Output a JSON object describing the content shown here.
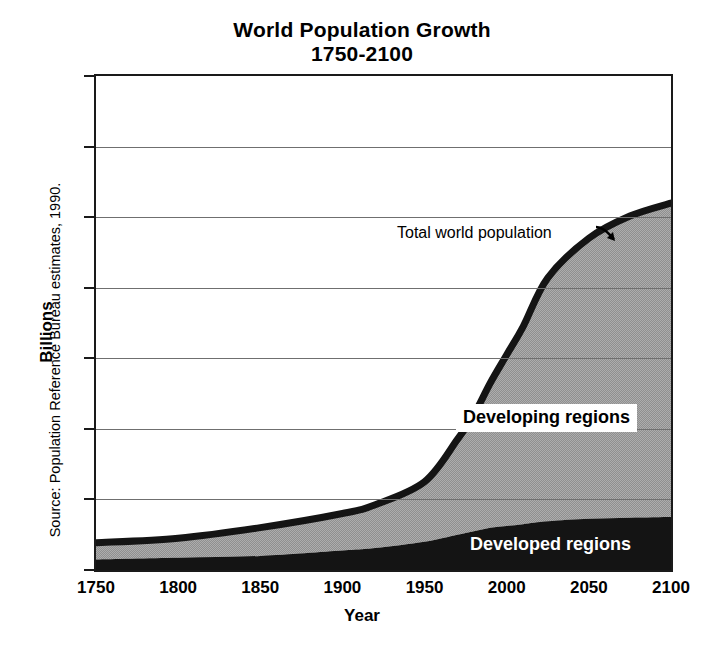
{
  "chart_data": {
    "type": "area",
    "title": "World Population Growth",
    "subtitle": "1750-2100",
    "xlabel": "Year",
    "ylabel": "Billions",
    "xlim": [
      1750,
      2100
    ],
    "ylim": [
      0,
      14
    ],
    "xticks": [
      1750,
      1800,
      1850,
      1900,
      1950,
      2000,
      2050,
      2100
    ],
    "yticks": [
      0,
      2,
      4,
      6,
      8,
      10,
      12,
      14
    ],
    "grid": "horizontal",
    "stacked": true,
    "legend_position": "inline-annotations",
    "source": "Source: Population Reference Bureau estimates, 1990.",
    "annotations": [
      {
        "text": "Total world population",
        "points_to": "top-curve",
        "arrow": "down-right"
      }
    ],
    "x": [
      1750,
      1800,
      1850,
      1900,
      1920,
      1950,
      1970,
      1980,
      1990,
      2000,
      2010,
      2025,
      2050,
      2075,
      2100
    ],
    "series": [
      {
        "name": "Developed regions",
        "fill": "#141414",
        "values": [
          0.3,
          0.35,
          0.4,
          0.55,
          0.62,
          0.8,
          1.0,
          1.1,
          1.2,
          1.25,
          1.3,
          1.38,
          1.45,
          1.48,
          1.5
        ]
      },
      {
        "name": "Developing regions",
        "fill": "#9a9a9a",
        "values": [
          0.47,
          0.55,
          0.8,
          1.05,
          1.23,
          1.7,
          2.7,
          3.3,
          4.1,
          4.85,
          5.6,
          6.9,
          7.95,
          8.55,
          8.9
        ]
      }
    ],
    "total": {
      "name": "Total world population",
      "line_color": "#141414",
      "values": [
        0.77,
        0.9,
        1.2,
        1.6,
        1.85,
        2.5,
        3.7,
        4.4,
        5.3,
        6.1,
        6.9,
        8.28,
        9.4,
        10.03,
        10.4
      ]
    }
  },
  "labels": {
    "title_line1": "World Population Growth",
    "title_line2": "1750-2100",
    "y_axis_title": "Billions",
    "x_axis_title": "Year",
    "source": "Source: Population Reference Bureau estimates, 1990.",
    "annotation_total": "Total world population",
    "legend_developing": "Developing regions",
    "legend_developed": "Developed regions",
    "yticks": [
      "0",
      "2",
      "4",
      "6",
      "8",
      "10",
      "12",
      "14"
    ],
    "xticks": [
      "1750",
      "1800",
      "1850",
      "1900",
      "1950",
      "2000",
      "2050",
      "2100"
    ]
  },
  "colors": {
    "developed_fill": "#141414",
    "developing_fill": "#9a9a9a",
    "curve_line": "#141414",
    "gridline": "#6f6f6f",
    "frame": "#1a1a1a",
    "background": "#ffffff"
  }
}
